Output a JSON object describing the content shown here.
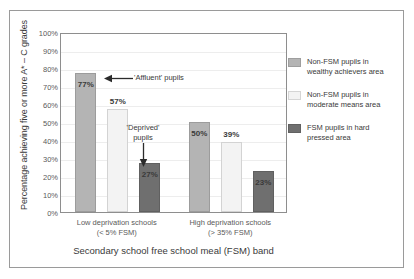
{
  "chart_data": {
    "type": "bar",
    "title": "",
    "subtitle": "",
    "xlabel": "Secondary school free school meal (FSM) band",
    "ylabel": "Percentage achieving five or more A* – C grades",
    "categories": [
      "Low deprivation schools (< 5% FSM)",
      "High deprivation schools (> 35% FSM)"
    ],
    "category_lines": [
      [
        "Low deprivation schools",
        "(< 5% FSM)"
      ],
      [
        "High deprivation schools",
        "(> 35% FSM)"
      ]
    ],
    "series": [
      {
        "name": "Non-FSM pupils in wealthy achievers area",
        "color": "#b4b4b4",
        "values": [
          77,
          50
        ],
        "labels": [
          "77%",
          "50%"
        ],
        "label_inside": [
          true,
          true
        ]
      },
      {
        "name": "Non-FSM pupils in moderate means area",
        "color": "#f3f3f3",
        "values": [
          57,
          39
        ],
        "labels": [
          "57%",
          "39%"
        ],
        "label_inside": [
          false,
          false
        ]
      },
      {
        "name": "FSM pupils in hard pressed area",
        "color": "#6f6f6f",
        "values": [
          27,
          23
        ],
        "labels": [
          "27%",
          "23%"
        ],
        "label_inside": [
          true,
          true
        ]
      }
    ],
    "ylim": [
      0,
      100
    ],
    "ystep": 10,
    "yticks": [
      "100%",
      "90%",
      "80%",
      "70%",
      "60%",
      "50%",
      "40%",
      "30%",
      "20%",
      "10%",
      "0%"
    ],
    "grid": true,
    "legend_position": "right",
    "annotations": [
      {
        "text": "'Affluent' pupils",
        "arrow": "left",
        "target": "77% bar"
      },
      {
        "text_lines": [
          "'Deprived'",
          "pupils"
        ],
        "arrow": "down",
        "target": "27% bar"
      }
    ]
  },
  "legend": {
    "items": [
      {
        "line1": "Non-FSM pupils in",
        "line2": "wealthy achievers area",
        "color": "#b4b4b4"
      },
      {
        "line1": "Non-FSM pupils in",
        "line2": "moderate means area",
        "color": "#f3f3f3"
      },
      {
        "line1": "FSM pupils in hard",
        "line2": "pressed area",
        "color": "#6f6f6f"
      }
    ]
  },
  "annotations": {
    "affluent": "'Affluent' pupils",
    "deprived_line1": "'Deprived'",
    "deprived_line2": "pupils"
  }
}
